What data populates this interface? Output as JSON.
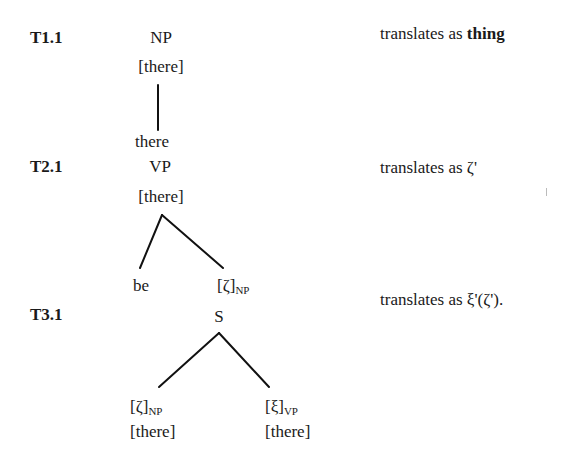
{
  "rules": [
    {
      "id": "T1.1",
      "tree": {
        "root": "NP",
        "root_feature": "[there]",
        "children": [
          {
            "label": "there"
          }
        ]
      },
      "translation": {
        "prefix": "translates as ",
        "value": "thing",
        "value_bold": true
      }
    },
    {
      "id": "T2.1",
      "tree": {
        "root": "VP",
        "root_feature": "[there]",
        "children": [
          {
            "label": "be"
          },
          {
            "label": "[ζ]",
            "subscript": "NP"
          }
        ]
      },
      "translation": {
        "prefix": "translates as ",
        "value": "ζ'"
      }
    },
    {
      "id": "T3.1",
      "tree": {
        "root": "S",
        "children": [
          {
            "label": "[ζ]",
            "subscript": "NP",
            "feature": "[there]"
          },
          {
            "label": "[ξ]",
            "subscript": "VP",
            "feature": "[there]"
          }
        ]
      },
      "translation": {
        "prefix": "translates as ",
        "value": "ξ'(ζ')."
      }
    }
  ]
}
